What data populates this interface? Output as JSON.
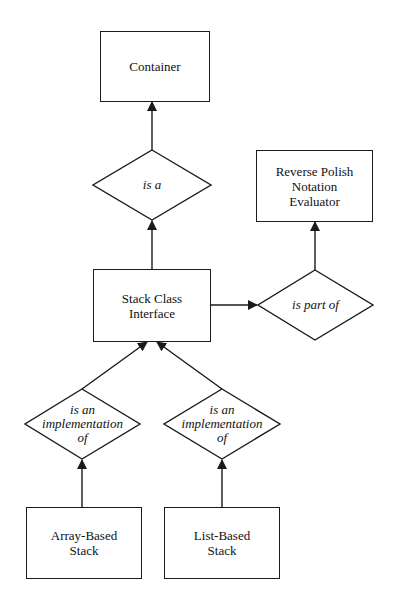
{
  "diagram": {
    "type": "entity-relationship",
    "nodes": {
      "container": {
        "label": "Container"
      },
      "rpn": {
        "label": "Reverse Polish\nNotation\nEvaluator",
        "lines": [
          "Reverse Polish",
          "Notation",
          "Evaluator"
        ]
      },
      "stack": {
        "label": "Stack Class\nInterface",
        "lines": [
          "Stack Class",
          "Interface"
        ]
      },
      "array": {
        "label": "Array-Based\nStack",
        "lines": [
          "Array-Based",
          "Stack"
        ]
      },
      "list": {
        "label": "List-Based\nStack",
        "lines": [
          "List-Based",
          "Stack"
        ]
      }
    },
    "relations": {
      "is_a": {
        "label": "is a"
      },
      "part_of": {
        "label": "is part of"
      },
      "impl_left": {
        "lines": [
          "is an",
          "implementation",
          "of"
        ]
      },
      "impl_right": {
        "lines": [
          "is an",
          "implementation",
          "of"
        ]
      }
    },
    "edges": [
      {
        "from": "Stack Class Interface",
        "via": "is a",
        "to": "Container"
      },
      {
        "from": "Stack Class Interface",
        "via": "is part of",
        "to": "Reverse Polish Notation Evaluator"
      },
      {
        "from": "Array-Based Stack",
        "via": "is an implementation of",
        "to": "Stack Class Interface"
      },
      {
        "from": "List-Based Stack",
        "via": "is an implementation of",
        "to": "Stack Class Interface"
      }
    ],
    "colors": {
      "stroke": "#1a1a1a",
      "background": "#ffffff"
    }
  }
}
